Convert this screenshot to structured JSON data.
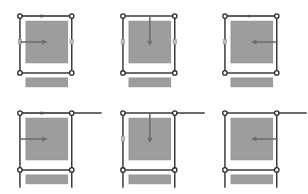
{
  "figure": {
    "type": "layout-constraint-diagram-grid",
    "columns": 3,
    "rows": 2,
    "background_color": "#ffffff",
    "frame_stroke_color": "#3a3a3a",
    "handle_fill_color": "#ffffff",
    "handle_stroke_color": "#2b2b2b",
    "content_fill_color": "#9d9d9d",
    "content_stroke_color": "#8a8a8a",
    "arrow_color": "#6e6e6e",
    "guide_color": "#a8a8a8",
    "bar_fill_color": "#9d9d9d"
  },
  "cells": [
    {
      "id": "cell-1",
      "name": "top-left",
      "row": 1,
      "column": 1,
      "frame_label": "selection-frame",
      "edges_extend": false,
      "arrow": {
        "name": "horizontal-margin-arrow",
        "direction": "right",
        "orientation": "horizontal",
        "origin": "left-edge",
        "label": ""
      },
      "top_guide": {
        "visible": true,
        "marker": "tick",
        "label": ""
      },
      "side_markers": [
        "left-mid-handle",
        "right-mid-handle"
      ],
      "content_block": {
        "name": "content-rectangle",
        "label": ""
      },
      "lower_bar": {
        "name": "lower-bar",
        "label": ""
      }
    },
    {
      "id": "cell-2",
      "name": "top-center",
      "row": 1,
      "column": 2,
      "frame_label": "selection-frame",
      "edges_extend": false,
      "arrow": {
        "name": "vertical-margin-arrow",
        "direction": "down",
        "orientation": "vertical",
        "origin": "top-edge",
        "label": ""
      },
      "top_guide": {
        "visible": false,
        "marker": "none",
        "label": ""
      },
      "side_markers": [
        "left-mid-handle",
        "right-mid-handle"
      ],
      "content_block": {
        "name": "content-rectangle",
        "label": ""
      },
      "lower_bar": {
        "name": "lower-bar",
        "label": ""
      }
    },
    {
      "id": "cell-3",
      "name": "top-right",
      "row": 1,
      "column": 3,
      "frame_label": "selection-frame",
      "edges_extend": false,
      "arrow": {
        "name": "horizontal-margin-arrow",
        "direction": "left",
        "orientation": "horizontal",
        "origin": "right-edge",
        "label": ""
      },
      "top_guide": {
        "visible": true,
        "marker": "arrow-left",
        "label": ""
      },
      "side_markers": [
        "left-mid-handle"
      ],
      "content_block": {
        "name": "content-rectangle",
        "label": ""
      },
      "lower_bar": {
        "name": "lower-bar",
        "label": ""
      }
    },
    {
      "id": "cell-4",
      "name": "bottom-left",
      "row": 2,
      "column": 1,
      "frame_label": "selection-frame",
      "edges_extend": true,
      "arrow": {
        "name": "horizontal-margin-arrow",
        "direction": "right",
        "orientation": "horizontal",
        "origin": "left-edge",
        "label": ""
      },
      "top_guide": {
        "visible": true,
        "marker": "tick",
        "label": ""
      },
      "side_markers": [],
      "content_block": {
        "name": "content-rectangle",
        "label": ""
      },
      "lower_bar": {
        "name": "lower-bar",
        "label": ""
      }
    },
    {
      "id": "cell-5",
      "name": "bottom-center",
      "row": 2,
      "column": 2,
      "frame_label": "selection-frame",
      "edges_extend": true,
      "arrow": {
        "name": "vertical-margin-arrow",
        "direction": "down",
        "orientation": "vertical",
        "origin": "top-edge",
        "label": ""
      },
      "top_guide": {
        "visible": false,
        "marker": "none",
        "label": ""
      },
      "side_markers": [
        "left-mid-handle"
      ],
      "content_block": {
        "name": "content-rectangle",
        "label": ""
      },
      "lower_bar": {
        "name": "lower-bar",
        "label": ""
      }
    },
    {
      "id": "cell-6",
      "name": "bottom-right",
      "row": 2,
      "column": 3,
      "frame_label": "selection-frame",
      "edges_extend": true,
      "arrow": {
        "name": "horizontal-margin-arrow",
        "direction": "left",
        "orientation": "horizontal",
        "origin": "right-edge",
        "label": ""
      },
      "top_guide": {
        "visible": false,
        "marker": "none",
        "label": ""
      },
      "side_markers": [],
      "content_block": {
        "name": "content-rectangle",
        "label": ""
      },
      "lower_bar": {
        "name": "lower-bar",
        "label": ""
      }
    }
  ]
}
